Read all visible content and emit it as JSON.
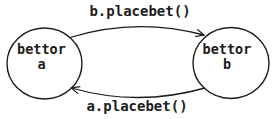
{
  "colors": {
    "ink": "#1c1c1c",
    "background": "#ffffff"
  },
  "diagram": {
    "nodes": [
      {
        "id": "bettor-a",
        "label_line1": "bettor",
        "label_line2": "a"
      },
      {
        "id": "bettor-b",
        "label_line1": "bettor",
        "label_line2": "b"
      }
    ],
    "edges": [
      {
        "id": "a-to-b",
        "label": "b.placebet()",
        "from": "bettor-a",
        "to": "bettor-b"
      },
      {
        "id": "b-to-a",
        "label": "a.placebet()",
        "from": "bettor-b",
        "to": "bettor-a"
      }
    ]
  }
}
